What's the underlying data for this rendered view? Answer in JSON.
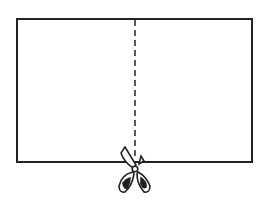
{
  "diagram": {
    "rectangle": {
      "x": 17,
      "y": 19,
      "width": 235,
      "height": 143,
      "stroke": "#222222"
    },
    "cut_line": {
      "x": 135,
      "y1": 19,
      "y2": 162,
      "style": "dashed"
    },
    "icon": "scissors-icon"
  }
}
